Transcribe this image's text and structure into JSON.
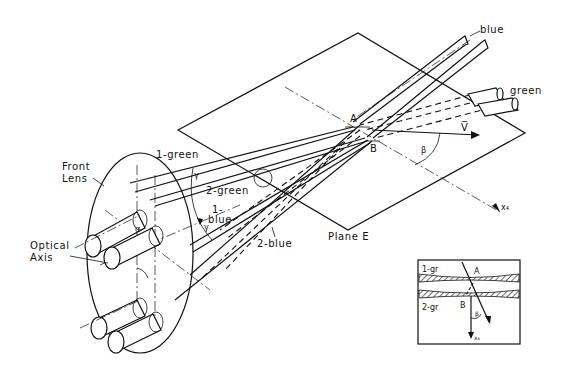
{
  "figure": {
    "type": "optical-schematic",
    "labels": {
      "blue_beam": "blue",
      "green_beam": "green",
      "point_a": "A",
      "point_b": "B",
      "velocity_vector": "V̅",
      "angle_beta": "β",
      "front_lens_line1": "Front",
      "front_lens_line2": "Lens",
      "beam_1_green": "1-green",
      "beam_2_green": "2-green",
      "beam_1_blue_line1": "1-",
      "beam_1_blue_line2": "blue",
      "beam_2_blue": "2-blue",
      "angle_gamma": "γ",
      "angle_alpha": "α",
      "optical_axis_line1": "Optical",
      "optical_axis_line2": "Axis",
      "plane_e": "Plane E",
      "axis_x4": "x₄"
    },
    "inset": {
      "label_1gr": "1-gr",
      "label_2gr": "2-gr",
      "point_a": "A",
      "point_b": "B",
      "angle_beta": "β",
      "axis_x4": "x₄"
    },
    "colors": {
      "line": "#111111",
      "background": "#ffffff"
    }
  }
}
